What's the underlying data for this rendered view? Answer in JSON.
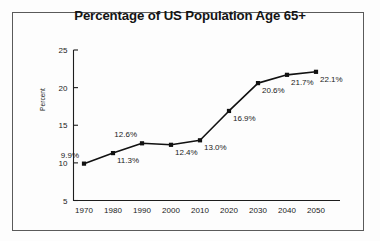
{
  "chart_data": {
    "type": "line",
    "title": "Percentage of US Population Age 65+",
    "xlabel": "",
    "ylabel": "Percent",
    "categories": [
      "1970",
      "1980",
      "1990",
      "2000",
      "2010",
      "2020",
      "2030",
      "2040",
      "2050"
    ],
    "x": [
      1970,
      1980,
      1990,
      2000,
      2010,
      2020,
      2030,
      2040,
      2050
    ],
    "values": [
      9.9,
      11.3,
      12.6,
      12.4,
      13.0,
      16.9,
      20.6,
      21.7,
      22.1
    ],
    "point_labels": [
      "9.9%",
      "11.3%",
      "12.6%",
      "12.4%",
      "13.0%",
      "16.9%",
      "20.6%",
      "21.7%",
      "22.1%"
    ],
    "label_positions": [
      "above-left",
      "below-right",
      "above-left",
      "below-right",
      "below-right",
      "below-right",
      "below-right",
      "below-right",
      "below-right"
    ],
    "ylim": [
      5,
      25
    ],
    "yticks": [
      5,
      10,
      15,
      20,
      25
    ],
    "ytick_labels": [
      "5",
      "10",
      "15",
      "20",
      "25"
    ],
    "xlim": [
      1965,
      2055
    ],
    "grid": false,
    "legend": false,
    "series": [
      {
        "name": "Percentage of US Population Age 65+",
        "values": [
          9.9,
          11.3,
          12.6,
          12.4,
          13.0,
          16.9,
          20.6,
          21.7,
          22.1
        ],
        "marker": "square",
        "color": "#111111"
      }
    ]
  },
  "figure": {
    "background_color": "#fdfdfd",
    "border_color": "#5a5a5a",
    "title_color": "#141414",
    "axis_color": "#1d1d1d"
  }
}
